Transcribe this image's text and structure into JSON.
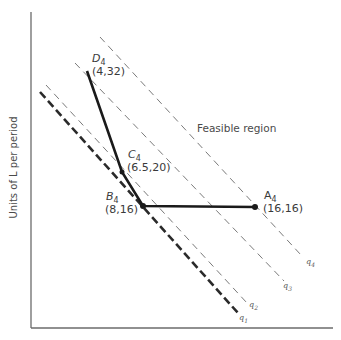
{
  "axes": {
    "y_label": "Units of L per period",
    "x_label": ""
  },
  "region_label": "Feasible region",
  "points": [
    {
      "id": "D",
      "name": "D",
      "sub": "4",
      "coords": "(4,32)",
      "px": [
        87,
        71
      ]
    },
    {
      "id": "C",
      "name": "C",
      "sub": "4",
      "coords": "(6.5,20)",
      "px": [
        122,
        172
      ]
    },
    {
      "id": "B",
      "name": "B",
      "sub": "4",
      "coords": "(8,16)",
      "px": [
        143,
        206
      ]
    },
    {
      "id": "A",
      "name": "A",
      "sub": "4",
      "coords": "(16,16)",
      "px": [
        255,
        207
      ]
    }
  ],
  "curves": [
    {
      "id": "q1",
      "name": "q",
      "sub": "1",
      "style": "heavy-dashed"
    },
    {
      "id": "q2",
      "name": "q",
      "sub": "2",
      "style": "dashed"
    },
    {
      "id": "q3",
      "name": "q",
      "sub": "3",
      "style": "dashed"
    },
    {
      "id": "q4",
      "name": "q",
      "sub": "4",
      "style": "dashed"
    }
  ],
  "colors": {
    "axis": "#6b6b6b",
    "solid_line": "#1a1a1a",
    "dashed_line": "#7a7a7a",
    "heavy_dashed": "#2a2a2a",
    "text": "#3a3a3a"
  }
}
